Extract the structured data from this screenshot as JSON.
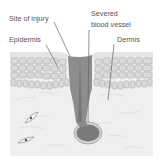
{
  "diagram": {
    "labels": {
      "site_of_injury": "Site of injury",
      "severed_line1": "Severed",
      "severed_line2": "blood vessel",
      "epidermis": "Epidermis",
      "dermis": "Dermis"
    },
    "colors": {
      "text": "#555555",
      "leader_line": "#666666",
      "wound": "#8a8a8a",
      "wound_dark": "#6f6f6f",
      "epidermis_cells": "#d2d2d2",
      "dermis": "#ececec",
      "cell_outline": "#a8a8a8"
    }
  }
}
